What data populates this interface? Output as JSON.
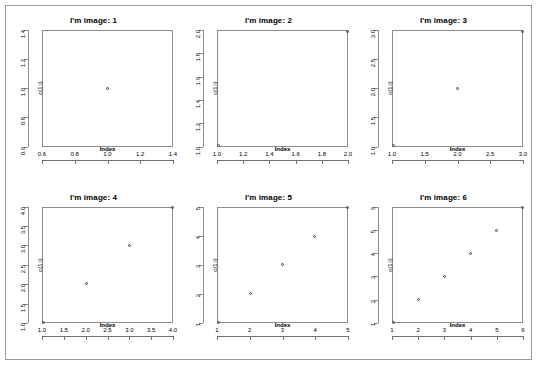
{
  "figure": {
    "device_background": "#ffffff",
    "frame_color": "#9a9a9a",
    "axis_color": "#8d8d8d",
    "point_color": "#3c3c3c",
    "grid_rows": 2,
    "grid_cols": 3
  },
  "chart_data": [
    {
      "type": "scatter",
      "title": "I'm image: 1",
      "xlabel": "Index",
      "ylabel": "c(1:i)",
      "x": [
        1
      ],
      "y": [
        1
      ],
      "xlim": [
        0.6,
        1.4
      ],
      "ylim": [
        0.6,
        1.4
      ],
      "xticks": [
        "0.6",
        "0.8",
        "1.0",
        "1.2",
        "1.4"
      ],
      "xtickvals": [
        0.6,
        0.8,
        1.0,
        1.2,
        1.4
      ],
      "yticks": [
        "0.6",
        "0.8",
        "1.0",
        "1.2",
        "1.4"
      ],
      "ytickvals": [
        0.6,
        0.8,
        1.0,
        1.2,
        1.4
      ],
      "grid": false,
      "legend": "none",
      "marker": "open-circle"
    },
    {
      "type": "scatter",
      "title": "I'm image: 2",
      "xlabel": "Index",
      "ylabel": "c(1:i)",
      "x": [
        1,
        2
      ],
      "y": [
        1,
        2
      ],
      "xlim": [
        1.0,
        2.0
      ],
      "ylim": [
        1.0,
        2.0
      ],
      "xticks": [
        "1.0",
        "1.2",
        "1.4",
        "1.6",
        "1.8",
        "2.0"
      ],
      "xtickvals": [
        1.0,
        1.2,
        1.4,
        1.6,
        1.8,
        2.0
      ],
      "yticks": [
        "1.0",
        "1.2",
        "1.4",
        "1.6",
        "1.8",
        "2.0"
      ],
      "ytickvals": [
        1.0,
        1.2,
        1.4,
        1.6,
        1.8,
        2.0
      ],
      "grid": false,
      "legend": "none",
      "marker": "open-circle"
    },
    {
      "type": "scatter",
      "title": "I'm image: 3",
      "xlabel": "Index",
      "ylabel": "c(1:i)",
      "x": [
        1,
        2,
        3
      ],
      "y": [
        1,
        2,
        3
      ],
      "xlim": [
        1.0,
        3.0
      ],
      "ylim": [
        1.0,
        3.0
      ],
      "xticks": [
        "1.0",
        "1.5",
        "2.0",
        "2.5",
        "3.0"
      ],
      "xtickvals": [
        1.0,
        1.5,
        2.0,
        2.5,
        3.0
      ],
      "yticks": [
        "1.0",
        "1.5",
        "2.0",
        "2.5",
        "3.0"
      ],
      "ytickvals": [
        1.0,
        1.5,
        2.0,
        2.5,
        3.0
      ],
      "grid": false,
      "legend": "none",
      "marker": "open-circle"
    },
    {
      "type": "scatter",
      "title": "I'm image: 4",
      "xlabel": "Index",
      "ylabel": "c(1:i)",
      "x": [
        1,
        2,
        3,
        4
      ],
      "y": [
        1,
        2,
        3,
        4
      ],
      "xlim": [
        1.0,
        4.0
      ],
      "ylim": [
        1.0,
        4.0
      ],
      "xticks": [
        "1.0",
        "1.5",
        "2.0",
        "2.5",
        "3.0",
        "3.5",
        "4.0"
      ],
      "xtickvals": [
        1.0,
        1.5,
        2.0,
        2.5,
        3.0,
        3.5,
        4.0
      ],
      "yticks": [
        "1.0",
        "1.5",
        "2.0",
        "2.5",
        "3.0",
        "3.5",
        "4.0"
      ],
      "ytickvals": [
        1.0,
        1.5,
        2.0,
        2.5,
        3.0,
        3.5,
        4.0
      ],
      "grid": false,
      "legend": "none",
      "marker": "open-circle"
    },
    {
      "type": "scatter",
      "title": "I'm image: 5",
      "xlabel": "Index",
      "ylabel": "c(1:i)",
      "x": [
        1,
        2,
        3,
        4,
        5
      ],
      "y": [
        1,
        2,
        3,
        4,
        5
      ],
      "xlim": [
        1,
        5
      ],
      "ylim": [
        1,
        5
      ],
      "xticks": [
        "1",
        "2",
        "3",
        "4",
        "5"
      ],
      "xtickvals": [
        1,
        2,
        3,
        4,
        5
      ],
      "yticks": [
        "1",
        "2",
        "3",
        "4",
        "5"
      ],
      "ytickvals": [
        1,
        2,
        3,
        4,
        5
      ],
      "grid": false,
      "legend": "none",
      "marker": "open-circle"
    },
    {
      "type": "scatter",
      "title": "I'm image: 6",
      "xlabel": "Index",
      "ylabel": "c(1:i)",
      "x": [
        1,
        2,
        3,
        4,
        5,
        6
      ],
      "y": [
        1,
        2,
        3,
        4,
        5,
        6
      ],
      "xlim": [
        1,
        6
      ],
      "ylim": [
        1,
        6
      ],
      "xticks": [
        "1",
        "2",
        "3",
        "4",
        "5",
        "6"
      ],
      "xtickvals": [
        1,
        2,
        3,
        4,
        5,
        6
      ],
      "yticks": [
        "1",
        "2",
        "3",
        "4",
        "5",
        "6"
      ],
      "ytickvals": [
        1,
        2,
        3,
        4,
        5,
        6
      ],
      "grid": false,
      "legend": "none",
      "marker": "open-circle"
    }
  ]
}
